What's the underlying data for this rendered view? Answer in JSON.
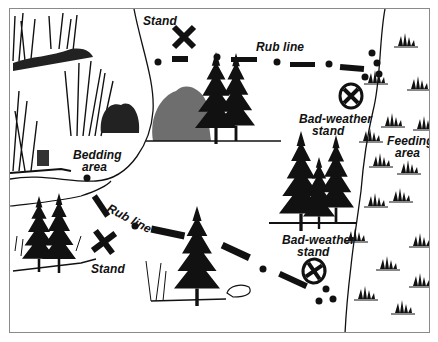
{
  "figure": {
    "type": "illustrated-hunting-map",
    "colors": {
      "ink": "#111111",
      "border": "#8a8a8a",
      "background": "#ffffff"
    }
  },
  "labels": {
    "stand_top": "Stand",
    "rub_line_top": "Rub line",
    "bad_weather_stand_top_1": "Bad-weather",
    "bad_weather_stand_top_2": "stand",
    "bedding_area_1": "Bedding",
    "bedding_area_2": "area",
    "feeding_area_1": "Feeding",
    "feeding_area_2": "area",
    "rub_line_bottom": "Rub line",
    "stand_bottom": "Stand",
    "bad_weather_stand_bottom_1": "Bad-weather",
    "bad_weather_stand_bottom_2": "stand"
  },
  "legend_symbols": {
    "stand": "x-mark-icon",
    "bad_weather_stand": "circled-x-icon",
    "rub_line": "dash-dot-line",
    "tree": "pine-tree-icon",
    "brush": "shrub-icon",
    "grass": "grass-tuft-icon"
  }
}
